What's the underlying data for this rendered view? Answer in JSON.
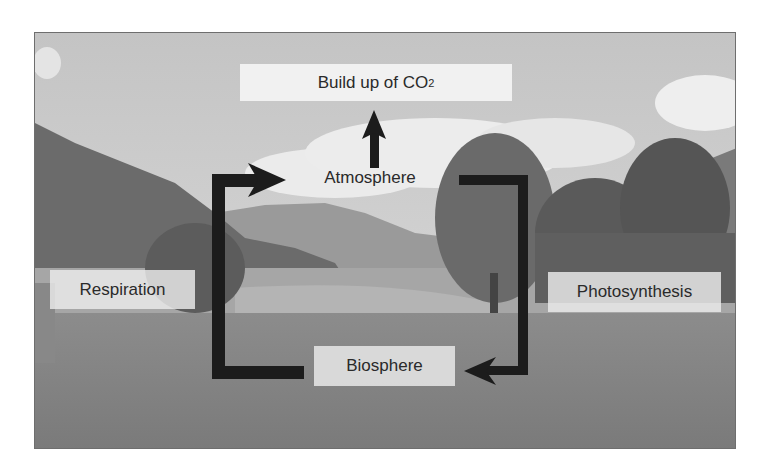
{
  "diagram": {
    "background": "grayscale landscape photo: lake valley with mountains, trees and grass meadow",
    "nodes": {
      "co2": {
        "text": "Build up of CO",
        "subscript": "2"
      },
      "atmosphere": {
        "text": "Atmosphere"
      },
      "biosphere": {
        "text": "Biosphere"
      },
      "respiration": {
        "text": "Respiration"
      },
      "photosynthesis": {
        "text": "Photosynthesis"
      }
    },
    "edges": [
      {
        "from": "Atmosphere",
        "to": "Build up of CO2",
        "direction": "up"
      },
      {
        "from": "Biosphere",
        "to": "Atmosphere",
        "via": "Respiration",
        "side": "left"
      },
      {
        "from": "Atmosphere",
        "to": "Biosphere",
        "via": "Photosynthesis",
        "side": "right"
      }
    ],
    "colors": {
      "arrow": "#1c1c1c",
      "label_bg": "#ececec",
      "text": "#2a2a2a"
    }
  }
}
